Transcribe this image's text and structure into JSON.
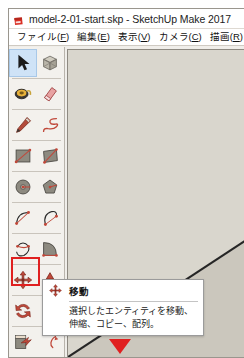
{
  "window": {
    "title": "model-2-01-start.skp - SketchUp Make 2017",
    "logo_icon": "sketchup-logo-icon"
  },
  "menu": {
    "items": [
      {
        "name": "menu-file",
        "text": "ファイル(",
        "mnemonic": "F",
        "tail": ")"
      },
      {
        "name": "menu-edit",
        "text": "編集(",
        "mnemonic": "E",
        "tail": ")"
      },
      {
        "name": "menu-view",
        "text": "表示(",
        "mnemonic": "V",
        "tail": ")"
      },
      {
        "name": "menu-camera",
        "text": "カメラ(",
        "mnemonic": "C",
        "tail": ")"
      },
      {
        "name": "menu-draw",
        "text": "描画(",
        "mnemonic": "R",
        "tail": ")"
      }
    ]
  },
  "toolbar": {
    "rows": [
      {
        "left": {
          "name": "select-tool",
          "icon": "cursor-arrow-icon",
          "selected": true
        },
        "right": {
          "name": "make-component-tool",
          "icon": "component-box-icon",
          "selected": false
        }
      },
      {
        "left": {
          "name": "paint-bucket-tool",
          "icon": "paint-bucket-icon",
          "selected": false
        },
        "right": {
          "name": "eraser-tool",
          "icon": "eraser-icon",
          "selected": false
        }
      },
      {
        "left": {
          "name": "line-tool",
          "icon": "pencil-icon",
          "selected": false
        },
        "right": {
          "name": "freehand-tool",
          "icon": "freehand-squiggle-icon",
          "selected": false
        }
      },
      {
        "left": {
          "name": "rectangle-tool",
          "icon": "rectangle-icon",
          "selected": false
        },
        "right": {
          "name": "rotated-rectangle-tool",
          "icon": "rotated-rectangle-icon",
          "selected": false
        }
      },
      {
        "left": {
          "name": "circle-tool",
          "icon": "circle-icon",
          "selected": false
        },
        "right": {
          "name": "polygon-tool",
          "icon": "polygon-icon",
          "selected": false
        }
      },
      {
        "left": {
          "name": "arc-tool",
          "icon": "arc-icon",
          "selected": false
        },
        "right": {
          "name": "two-point-arc-tool",
          "icon": "two-point-arc-icon",
          "selected": false
        }
      },
      {
        "left": {
          "name": "three-point-arc-tool",
          "icon": "three-point-arc-icon",
          "selected": false
        },
        "right": {
          "name": "pie-tool",
          "icon": "pie-icon",
          "selected": false
        }
      },
      {
        "left": {
          "name": "move-tool",
          "icon": "move-four-arrows-icon",
          "selected": false
        },
        "right": {
          "name": "push-pull-tool",
          "icon": "push-pull-icon",
          "selected": false
        }
      },
      {
        "left": {
          "name": "rotate-tool",
          "icon": "rotate-arrows-icon",
          "selected": false
        },
        "right": {
          "name": "move-tool-duplicate",
          "icon": "move-four-arrows-icon",
          "selected": false
        }
      },
      {
        "left": {
          "name": "follow-me-tool",
          "icon": "follow-me-icon",
          "selected": false
        },
        "right": {
          "name": "scale-tool",
          "icon": "scale-icon",
          "selected": false
        }
      }
    ]
  },
  "tooltip": {
    "icon": "move-four-arrows-icon",
    "title": "移動",
    "body": "選択したエンティティを移動、伸縮、コピー、配列。"
  },
  "annotations": {
    "highlight_color": "#e02020",
    "highlight_target": "move-tool",
    "arrow_icon": "red-down-triangle-icon"
  },
  "canvas": {
    "background_color": "#d7d4cb",
    "face_color": "#c9c5bb",
    "edge_color": "#262626"
  }
}
